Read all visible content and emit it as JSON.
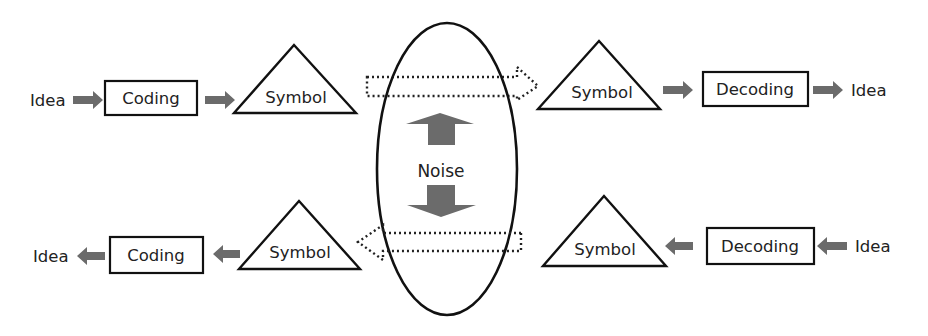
{
  "diagram": {
    "type": "communication-model",
    "colors": {
      "stroke": "#111111",
      "arrow_fill": "#6b6b6b",
      "background": "#ffffff"
    },
    "top_row": {
      "direction": "left-to-right",
      "idea_in": "Idea",
      "coding": "Coding",
      "symbol_sender": "Symbol",
      "symbol_receiver": "Symbol",
      "decoding": "Decoding",
      "idea_out": "Idea"
    },
    "bottom_row": {
      "direction": "right-to-left",
      "idea_out": "Idea",
      "coding": "Coding",
      "symbol_receiver": "Symbol",
      "symbol_sender": "Symbol",
      "decoding": "Decoding",
      "idea_in": "Idea"
    },
    "channel": {
      "label": "Noise",
      "shape": "ellipse",
      "noise_arrows": [
        "up",
        "down"
      ],
      "transmission_arrows": [
        "right (dotted, top)",
        "left (dotted, bottom)"
      ]
    }
  }
}
